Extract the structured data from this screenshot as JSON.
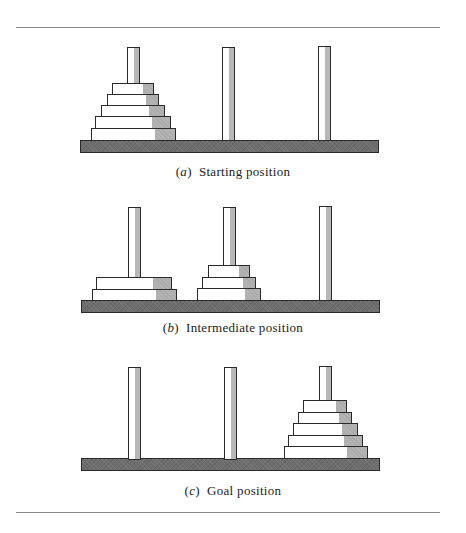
{
  "figure": {
    "colors": {
      "base": "#6e6e6e",
      "disk_shade": "#b3b3b3",
      "outline": "#2a2a2a",
      "rule": "#8a8a8a"
    },
    "panels": [
      {
        "id": "a",
        "label": "a",
        "caption": "Starting position",
        "pegs": [
          {
            "peg": 1,
            "disks": [
              5,
              4,
              3,
              2,
              1
            ]
          },
          {
            "peg": 2,
            "disks": []
          },
          {
            "peg": 3,
            "disks": []
          }
        ]
      },
      {
        "id": "b",
        "label": "b",
        "caption": "Intermediate position",
        "pegs": [
          {
            "peg": 1,
            "disks": [
              5,
              4
            ]
          },
          {
            "peg": 2,
            "disks": [
              3,
              2,
              1
            ]
          },
          {
            "peg": 3,
            "disks": []
          }
        ]
      },
      {
        "id": "c",
        "label": "c",
        "caption": "Goal position",
        "pegs": [
          {
            "peg": 1,
            "disks": []
          },
          {
            "peg": 2,
            "disks": []
          },
          {
            "peg": 3,
            "disks": [
              5,
              4,
              3,
              2,
              1
            ]
          }
        ]
      }
    ]
  }
}
